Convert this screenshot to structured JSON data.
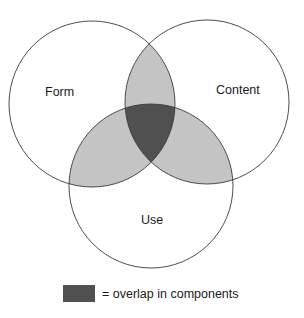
{
  "diagram": {
    "type": "venn",
    "sets": [
      {
        "id": "form",
        "label": "Form"
      },
      {
        "id": "content",
        "label": "Content"
      },
      {
        "id": "use",
        "label": "Use"
      }
    ],
    "colors": {
      "pairwise_overlap": "#c4c4c4",
      "triple_overlap": "#505050",
      "outline": "#3a3a3a",
      "background": "#ffffff"
    }
  },
  "legend": {
    "swatch_color": "#505050",
    "text": "= overlap in components"
  }
}
